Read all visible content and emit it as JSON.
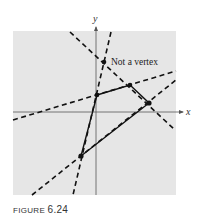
{
  "figure": {
    "caption_label": "FIGURE",
    "caption_number": "6.24",
    "axis_x_label": "x",
    "axis_y_label": "y",
    "annotation": "Not a vertex",
    "colors": {
      "background": "#e6e6e6",
      "lines": "#111111",
      "axes": "#555555"
    }
  },
  "diagram": {
    "plot_box": {
      "x": 13,
      "y": 31,
      "width": 163,
      "height": 164
    },
    "origin": {
      "x": 96,
      "y": 112
    },
    "feasible_region_vertices": [
      {
        "x": 97,
        "y": 95
      },
      {
        "x": 130,
        "y": 85
      },
      {
        "x": 149,
        "y": 103
      },
      {
        "x": 81,
        "y": 156
      }
    ],
    "non_vertex_point": {
      "x": 104,
      "y": 62
    },
    "dashed_boundary_lines": [
      {
        "x1": 13,
        "y1": 120,
        "x2": 176,
        "y2": 71
      },
      {
        "x1": 70,
        "y1": 32,
        "x2": 175,
        "y2": 130
      },
      {
        "x1": 111,
        "y1": 32,
        "x2": 73,
        "y2": 195
      },
      {
        "x1": 32,
        "y1": 195,
        "x2": 176,
        "y2": 80
      }
    ]
  }
}
